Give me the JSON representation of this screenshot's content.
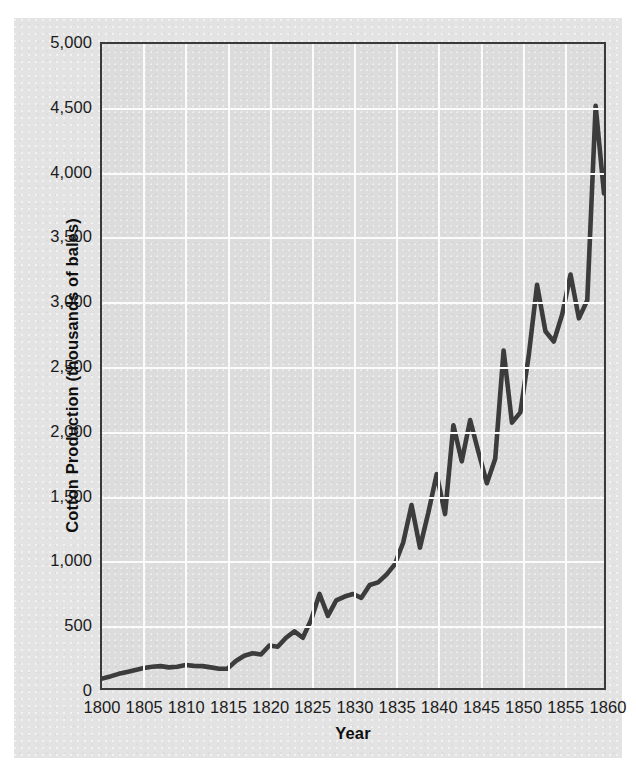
{
  "chart_data": {
    "type": "line",
    "title": "",
    "xlabel": "Year",
    "ylabel": "Cotton Production (thousands of bales)",
    "xlim": [
      1800,
      1860
    ],
    "ylim": [
      0,
      5000
    ],
    "grid": true,
    "legend": false,
    "legend_position": "none",
    "line_color": "#3c3c3c",
    "plot_background_color": "#dcdcdc",
    "figure_background_color": "#e3e3e3",
    "gridline_color": "#fbfbfb",
    "axis_border_color": "#3a3a3a",
    "xticks": [
      1800,
      1805,
      1810,
      1815,
      1820,
      1825,
      1830,
      1835,
      1840,
      1845,
      1850,
      1855,
      1860
    ],
    "xtick_labels": [
      "1800",
      "1805",
      "1810",
      "1815",
      "1820",
      "1825",
      "1830",
      "1835",
      "1840",
      "1845",
      "1850",
      "1855",
      "1860"
    ],
    "yticks": [
      0,
      500,
      1000,
      1500,
      2000,
      2500,
      3000,
      3500,
      4000,
      4500,
      5000
    ],
    "ytick_labels": [
      "0",
      "500",
      "1,000",
      "1,500",
      "2,000",
      "2,500",
      "3,000",
      "3,500",
      "4,000",
      "4,500",
      "5,000"
    ],
    "x": [
      1800,
      1801,
      1802,
      1803,
      1804,
      1805,
      1806,
      1807,
      1808,
      1809,
      1810,
      1811,
      1812,
      1813,
      1814,
      1815,
      1816,
      1817,
      1818,
      1819,
      1820,
      1821,
      1822,
      1823,
      1824,
      1825,
      1826,
      1827,
      1828,
      1829,
      1830,
      1831,
      1832,
      1833,
      1834,
      1835,
      1836,
      1837,
      1838,
      1839,
      1840,
      1841,
      1842,
      1843,
      1844,
      1845,
      1846,
      1847,
      1848,
      1849,
      1850,
      1851,
      1852,
      1853,
      1854,
      1855,
      1856,
      1857,
      1858,
      1859,
      1860
    ],
    "values": [
      73,
      90,
      110,
      125,
      140,
      155,
      165,
      170,
      160,
      165,
      178,
      172,
      170,
      160,
      150,
      150,
      210,
      250,
      270,
      260,
      330,
      320,
      390,
      440,
      390,
      530,
      730,
      560,
      680,
      710,
      730,
      700,
      800,
      820,
      880,
      960,
      1130,
      1420,
      1090,
      1360,
      1660,
      1350,
      2040,
      1760,
      2080,
      1830,
      1590,
      1780,
      2620,
      2060,
      2140,
      2580,
      3130,
      2770,
      2690,
      2900,
      3210,
      2870,
      3010,
      4520,
      3840
    ]
  },
  "annotations": {
    "y_axis_title": "Cotton Production (thousands of bales)",
    "x_axis_title": "Year"
  }
}
